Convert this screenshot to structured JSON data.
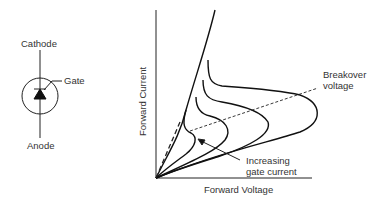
{
  "symbol": {
    "cathode_label": "Cathode",
    "gate_label": "Gate",
    "anode_label": "Anode"
  },
  "graph": {
    "y_axis_label": "Forward Current",
    "x_axis_label": "Forward Voltage",
    "breakover_line1": "Breakover",
    "breakover_line2": "voltage",
    "gate_line1": "Increasing",
    "gate_line2": "gate current"
  }
}
